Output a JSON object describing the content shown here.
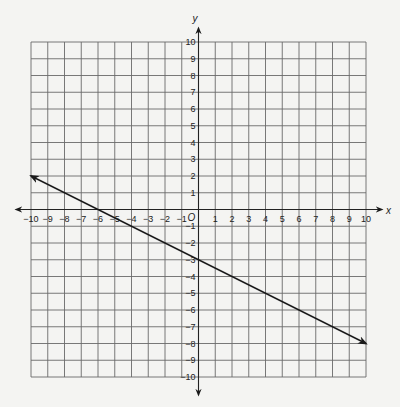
{
  "chart_data": {
    "type": "line",
    "title": "",
    "xlabel": "x",
    "ylabel": "y",
    "origin_label": "O",
    "xlim": [
      -10,
      10
    ],
    "ylim": [
      -10,
      10
    ],
    "grid": true,
    "x_ticks": [
      -10,
      -9,
      -8,
      -7,
      -6,
      -5,
      -4,
      -3,
      -2,
      -1,
      1,
      2,
      3,
      4,
      5,
      6,
      7,
      8,
      9,
      10
    ],
    "y_ticks": [
      -10,
      -9,
      -8,
      -7,
      -6,
      -5,
      -4,
      -3,
      -2,
      -1,
      1,
      2,
      3,
      4,
      5,
      6,
      7,
      8,
      9,
      10
    ],
    "series": [
      {
        "name": "line",
        "equation": "y = -0.5x - 3",
        "slope": -0.5,
        "y_intercept": -3,
        "x_intercept": -6,
        "points": [
          [
            -10,
            2
          ],
          [
            -6,
            0
          ],
          [
            0,
            -3
          ],
          [
            10,
            -8
          ]
        ],
        "arrows": "both ends",
        "color": "#1a1a1a"
      }
    ]
  },
  "layout": {
    "grid_left": 31,
    "grid_top": 42,
    "grid_size": 335,
    "units": 20,
    "x_axis_extent": [
      16,
      382
    ],
    "y_axis_extent": [
      28,
      395
    ]
  }
}
